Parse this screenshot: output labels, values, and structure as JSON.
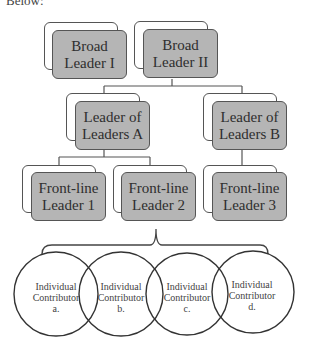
{
  "caption": "Below:",
  "tiers": {
    "broad_leaders": [
      {
        "line1": "Broad",
        "line2": "Leader I"
      },
      {
        "line1": "Broad",
        "line2": "Leader II"
      }
    ],
    "leaders_of_leaders": [
      {
        "line1": "Leader of",
        "line2": "Leaders A"
      },
      {
        "line1": "Leader of",
        "line2": "Leaders B"
      }
    ],
    "front_line_leaders": [
      {
        "line1": "Front-line",
        "line2": "Leader 1"
      },
      {
        "line1": "Front-line",
        "line2": "Leader 2"
      },
      {
        "line1": "Front-line",
        "line2": "Leader 3"
      }
    ],
    "individual_contributors": [
      {
        "line1": "Individual",
        "line2": "Contributor",
        "line3": "a."
      },
      {
        "line1": "Individual",
        "line2": "Contributor",
        "line3": "b."
      },
      {
        "line1": "Individual",
        "line2": "Contributor",
        "line3": "c."
      },
      {
        "line1": "Individual",
        "line2": "Contributor",
        "line3": "d."
      }
    ]
  },
  "colors": {
    "box_fill": "#b5b5b5",
    "box_border": "#555555",
    "line": "#444444",
    "text": "#2e2e2e"
  }
}
